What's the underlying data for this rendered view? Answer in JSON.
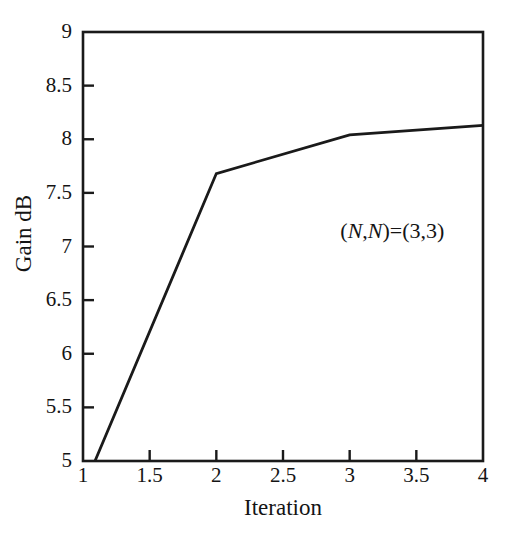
{
  "chart_data": {
    "type": "line",
    "title": "",
    "xlabel": "Iteration",
    "ylabel": "Gain dB",
    "xlim": [
      1,
      4
    ],
    "ylim": [
      5,
      9
    ],
    "grid": false,
    "legend": null,
    "x_ticks": [
      "1",
      "1.5",
      "2",
      "2.5",
      "3",
      "3.5",
      "4"
    ],
    "x_tick_values": [
      1,
      1.5,
      2,
      2.5,
      3,
      3.5,
      4
    ],
    "y_ticks": [
      "5",
      "5.5",
      "6",
      "6.5",
      "7",
      "7.5",
      "8",
      "8.5",
      "9"
    ],
    "y_tick_values": [
      5,
      5.5,
      6,
      6.5,
      7,
      7.5,
      8,
      8.5,
      9
    ],
    "series": [
      {
        "name": "Gain dB",
        "color": "#1a1a1a",
        "x": [
          1.09,
          2,
          3,
          4
        ],
        "values": [
          5.0,
          7.68,
          8.04,
          8.13
        ]
      }
    ],
    "annotations": [
      {
        "text": "(N,N)=(3,3)",
        "parts": [
          {
            "text": "(",
            "italic": false
          },
          {
            "text": "N",
            "italic": true
          },
          {
            "text": ",",
            "italic": false
          },
          {
            "text": "N",
            "italic": true
          },
          {
            "text": ")=(3,3)",
            "italic": false
          }
        ],
        "x": 2.93,
        "y": 7.14
      }
    ],
    "line_color": "#1a1a1a",
    "axis_color": "#1a1a1a",
    "background_color": "#ffffff"
  }
}
